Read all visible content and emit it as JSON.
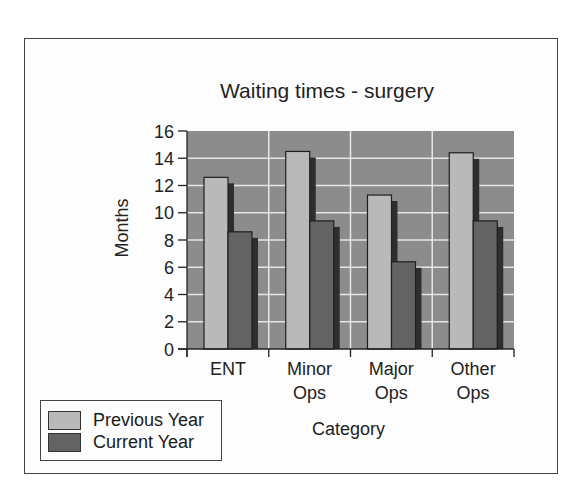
{
  "chart_data": {
    "type": "bar",
    "title": "Waiting times - surgery",
    "xlabel": "Category",
    "ylabel": "Months",
    "ylim": [
      0,
      16
    ],
    "yticks": [
      0,
      2,
      4,
      6,
      8,
      10,
      12,
      14,
      16
    ],
    "grid": true,
    "legend_position": "bottom-left",
    "categories": [
      "ENT",
      "Minor Ops",
      "Major Ops",
      "Other Ops"
    ],
    "category_lines": [
      [
        "ENT"
      ],
      [
        "Minor",
        "Ops"
      ],
      [
        "Major",
        "Ops"
      ],
      [
        "Other",
        "Ops"
      ]
    ],
    "series": [
      {
        "name": "Previous Year",
        "values": [
          12.6,
          14.5,
          11.3,
          14.4
        ],
        "color": "#b9b9b9"
      },
      {
        "name": "Current Year",
        "values": [
          8.6,
          9.4,
          6.4,
          9.4
        ],
        "color": "#636363"
      }
    ],
    "colors": {
      "plot_bg": "#8c8c8c",
      "grid": "#e6e6e6",
      "shadow": "#2e2e2e",
      "axis": "#222222"
    }
  },
  "legend": {
    "items": [
      {
        "label": "Previous Year",
        "color": "#b9b9b9"
      },
      {
        "label": "Current Year",
        "color": "#636363"
      }
    ]
  }
}
